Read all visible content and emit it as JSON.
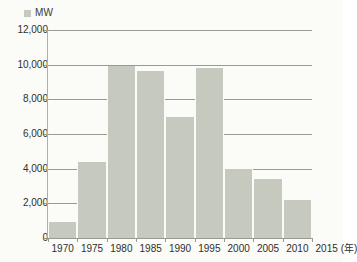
{
  "chart_data": {
    "type": "bar",
    "title": "",
    "subtitle": "",
    "xlabel": "(年)",
    "ylabel": "",
    "categories": [
      "1970",
      "1975",
      "1980",
      "1985",
      "1990",
      "1995",
      "2000",
      "2005",
      "2010",
      "2015"
    ],
    "values": [
      900,
      4400,
      9900,
      9650,
      7000,
      9800,
      4000,
      3400,
      2200,
      null
    ],
    "series": [
      {
        "name": "MW",
        "values": [
          900,
          4400,
          9900,
          9650,
          7000,
          9800,
          4000,
          3400,
          2200,
          null
        ]
      }
    ],
    "ylim": [
      0,
      12000
    ],
    "ytick_labels": [
      "0",
      "2,000",
      "4,000",
      "6,000",
      "8,000",
      "10,000",
      "12,000"
    ],
    "ytick_values": [
      0,
      2000,
      4000,
      6000,
      8000,
      10000,
      12000
    ],
    "xtick_labels": [
      "1970",
      "1975",
      "1980",
      "1985",
      "1990",
      "1995",
      "2000",
      "2005",
      "2010",
      "2015"
    ],
    "grid": true,
    "legend_position": "top-left",
    "legend": [
      {
        "label": "MW",
        "color": "#c6c9be"
      }
    ],
    "bar_color": "#c6c9be",
    "grid_color": "#9a9a92",
    "background_color": "#fbfbf8",
    "text_color": "#2f2f2c",
    "note": "Bars occupy the 5-year interval starting at each labeled tick; no bar is drawn at 2015."
  }
}
